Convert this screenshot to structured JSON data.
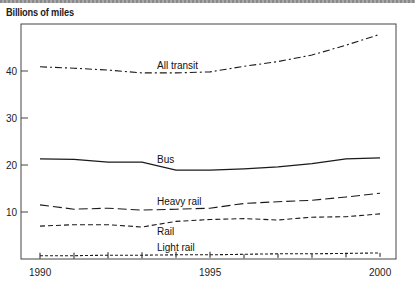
{
  "chart_data": {
    "type": "line",
    "title": "",
    "ylabel": "Billions of miles",
    "xlabel": "",
    "x": [
      1990,
      1991,
      1992,
      1993,
      1994,
      1995,
      1996,
      1997,
      1998,
      1999,
      2000
    ],
    "x_tick_labels": [
      "1990",
      "1995",
      "2000"
    ],
    "y_tick_labels": [
      "10",
      "20",
      "30",
      "40"
    ],
    "ylim": [
      0,
      50
    ],
    "xlim": [
      1988.5,
      2000.5
    ],
    "grid": false,
    "legend": "inline labels",
    "series": [
      {
        "name": "All transit",
        "style": "dash-dot",
        "values": [
          40.9,
          40.6,
          40.2,
          39.6,
          39.6,
          39.8,
          41.0,
          42.0,
          43.4,
          45.5,
          47.8
        ]
      },
      {
        "name": "Bus",
        "style": "solid",
        "values": [
          21.3,
          21.2,
          20.6,
          20.6,
          18.9,
          18.9,
          19.2,
          19.6,
          20.3,
          21.3,
          21.5
        ]
      },
      {
        "name": "Heavy rail",
        "style": "long-dash",
        "values": [
          11.5,
          10.6,
          10.8,
          10.4,
          10.6,
          10.8,
          11.8,
          12.2,
          12.5,
          13.2,
          14.0
        ]
      },
      {
        "name": "Rail",
        "style": "short-dash",
        "values": [
          7.0,
          7.3,
          7.3,
          6.8,
          8.0,
          8.4,
          8.6,
          8.3,
          8.9,
          9.0,
          9.6
        ]
      },
      {
        "name": "Light rail",
        "style": "dotted-with-markers",
        "values": [
          0.7,
          0.7,
          0.8,
          0.8,
          0.9,
          0.9,
          1.0,
          1.1,
          1.1,
          1.2,
          1.3
        ]
      }
    ]
  },
  "labels": {
    "ylabel": "Billions of miles",
    "all_transit": "All transit",
    "bus": "Bus",
    "heavy_rail": "Heavy rail",
    "rail": "Rail",
    "light_rail": "Light rail",
    "x1990": "1990",
    "x1995": "1995",
    "x2000": "2000",
    "y10": "10",
    "y20": "20",
    "y30": "30",
    "y40": "40"
  }
}
